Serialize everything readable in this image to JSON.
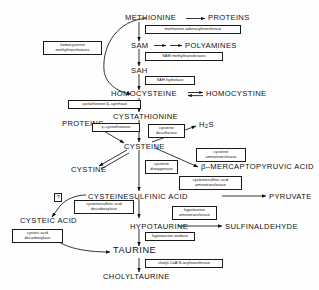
{
  "diagram": {
    "ink_color": "#111111",
    "background_color": "#fefefe"
  },
  "metabolites": {
    "methionine": "METHIONINE",
    "proteins_top": "PROTEINS",
    "sam": "SAM",
    "polyamines": "POLYAMINES",
    "sah": "SAH",
    "homocysteine": "HOMOCYSTEINE",
    "homocystine": "HOMOCYSTINE",
    "cystathionine": "CYSTATHIONINE",
    "proteins_mid": "PROTEINS",
    "cysteine": "CYSTEINE",
    "cystine": "CYSTINE",
    "h2s_pre": "H",
    "h2s_sub": "2",
    "h2s_post": "S",
    "mercaptopyruvic": "β–MERCAPTOPYRUVIC  ACID",
    "cysteinesulfinic_acid": "CYSTEINESULFINIC  ACID",
    "pyruvate": "PYRUVATE",
    "cysteic_acid": "CYSTEIC  ACID",
    "hypotaurine": "HYPOTAURINE",
    "sulfinaldehyde": "SULFINALDEHYDE",
    "taurine": "TAURINE",
    "cholyltaurine": "CHOLYLTAURINE"
  },
  "enzymes": {
    "methionine_adenosyltransferase": "methionine  adenosyltransferase",
    "sam_methyltransferases": "SAM methyltransferases",
    "sah_hydrolase": "SAH hydrolase",
    "homocysteine_methyltransferases": "homocysteine\nmethyltransferases",
    "cystathionine_beta_synthase": "cystathionine  β–synthase",
    "gamma_cystathionase": "γ–cystathionase",
    "cysteine_desulfurase": "cysteine\ndesulfurase",
    "cysteine_aminotransferase": "cysteine\naminotransferase",
    "cysteine_dioxygenase": "cysteine\ndioxygenase",
    "cysteinesulfinic_acid_aminotransferase": "cysteinesulfinic acid\naminotransferase",
    "cysteinesulfinic_acid_decarboxylase": "cysteinesulfinic acid\ndecarboxylase",
    "cysteic_acid_decarboxylase": "cysteic acid\ndecarboxylase",
    "hypotaurine_aminotransferase": "hypotaurine\naminotransferase",
    "hypotaurine_oxidase": "hypotaurine oxidase",
    "cholyl_coa_n_acyltransferase": "cholyl-CoA  N-acyltransferase",
    "unknown_marker": "?"
  }
}
